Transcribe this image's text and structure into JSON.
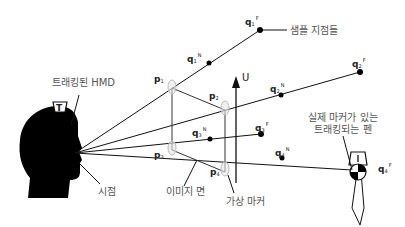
{
  "diagram": {
    "labels": {
      "tracked_hmd": "트래킹된 HMD",
      "viewpoint": "시점",
      "image_plane": "이미지 면",
      "virtual_marker": "가상 마커",
      "sample_points": "샘플 지점들",
      "tracked_pen_line1": "실제 마커가 있는",
      "tracked_pen_line2": "트래킹되는 펜",
      "up_axis": "U",
      "hmd_tag": "T",
      "pen_tag": "I"
    },
    "points": {
      "p1": {
        "base": "p",
        "sub": "1"
      },
      "p2": {
        "base": "p",
        "sub": "2"
      },
      "p3": {
        "base": "p",
        "sub": "3"
      },
      "p4": {
        "base": "p",
        "sub": "4"
      },
      "q1N": {
        "base": "q",
        "sub": "1",
        "sup": "N"
      },
      "q1F": {
        "base": "q",
        "sub": "1",
        "sup": "F"
      },
      "q2N": {
        "base": "q",
        "sub": "2",
        "sup": "N"
      },
      "q2F": {
        "base": "q",
        "sub": "2",
        "sup": "F"
      },
      "q3N": {
        "base": "q",
        "sub": "3",
        "sup": "N"
      },
      "q3F": {
        "base": "q",
        "sub": "3",
        "sup": "F"
      },
      "q4N": {
        "base": "q",
        "sub": "4",
        "sup": "N"
      },
      "q4F": {
        "base": "q",
        "sub": "4",
        "sup": "F"
      }
    },
    "colors": {
      "line": "#111111",
      "label": "#555555",
      "marker_fill": "#dddddd"
    }
  }
}
